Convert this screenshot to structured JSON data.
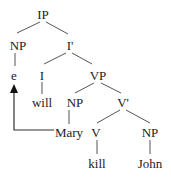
{
  "diagram": {
    "type": "syntax-tree",
    "line_color": "#555555",
    "text_color": "#222222",
    "nodes": [
      {
        "id": "ip",
        "label": "IP",
        "x": 43,
        "y": 14
      },
      {
        "id": "np-subject",
        "label": "NP",
        "x": 18,
        "y": 45
      },
      {
        "id": "i-bar",
        "label": "I'",
        "x": 70,
        "y": 45
      },
      {
        "id": "e",
        "label": "e",
        "x": 14,
        "y": 75
      },
      {
        "id": "i",
        "label": "I",
        "x": 42,
        "y": 75
      },
      {
        "id": "vp",
        "label": "VP",
        "x": 98,
        "y": 75
      },
      {
        "id": "will",
        "label": "will",
        "x": 42,
        "y": 102
      },
      {
        "id": "np-mary",
        "label": "NP",
        "x": 75,
        "y": 102
      },
      {
        "id": "v-bar",
        "label": "V'",
        "x": 123,
        "y": 102
      },
      {
        "id": "mary",
        "label": "Mary",
        "x": 69,
        "y": 132
      },
      {
        "id": "v",
        "label": "V",
        "x": 96,
        "y": 132
      },
      {
        "id": "np-object",
        "label": "NP",
        "x": 150,
        "y": 132
      },
      {
        "id": "kill",
        "label": "kill",
        "x": 97,
        "y": 163
      },
      {
        "id": "john",
        "label": "John",
        "x": 150,
        "y": 163
      }
    ],
    "edges": [
      {
        "from": [
          40,
          22
        ],
        "to": [
          17,
          33
        ]
      },
      {
        "from": [
          46,
          22
        ],
        "to": [
          68,
          34
        ]
      },
      {
        "from": [
          15,
          53
        ],
        "to": [
          15,
          66
        ]
      },
      {
        "from": [
          66,
          53
        ],
        "to": [
          44,
          64
        ]
      },
      {
        "from": [
          72,
          53
        ],
        "to": [
          92,
          64
        ]
      },
      {
        "from": [
          42,
          82
        ],
        "to": [
          42,
          94
        ]
      },
      {
        "from": [
          94,
          83
        ],
        "to": [
          75,
          93
        ]
      },
      {
        "from": [
          101,
          83
        ],
        "to": [
          121,
          93
        ]
      },
      {
        "from": [
          69,
          110
        ],
        "to": [
          69,
          124
        ]
      },
      {
        "from": [
          120,
          110
        ],
        "to": [
          97,
          123
        ]
      },
      {
        "from": [
          126,
          110
        ],
        "to": [
          150,
          123
        ]
      },
      {
        "from": [
          97,
          140
        ],
        "to": [
          97,
          154
        ]
      },
      {
        "from": [
          150,
          140
        ],
        "to": [
          150,
          154
        ]
      }
    ],
    "movement_arrow": {
      "from_node": "mary",
      "to_node": "e",
      "path": [
        [
          54,
          130
        ],
        [
          14,
          130
        ],
        [
          14,
          92
        ]
      ],
      "arrowhead": {
        "tip": [
          14,
          84
        ],
        "base_left": [
          10,
          93
        ],
        "base_right": [
          18,
          93
        ]
      }
    }
  }
}
